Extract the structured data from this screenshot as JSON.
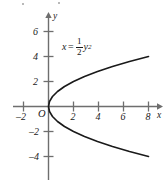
{
  "chart_data": {
    "type": "line",
    "title": "",
    "equation_label": {
      "lhs": "x",
      "relation": "=",
      "coefficient_numerator": "1",
      "coefficient_denominator": "2",
      "variable": "y",
      "exponent": "2",
      "plain": "x = 1/2 y^2"
    },
    "xlabel": "x",
    "ylabel": "y",
    "xlim": [
      -2.8,
      9.2
    ],
    "ylim": [
      -5.8,
      7.0
    ],
    "grid": false,
    "legend": null,
    "origin_label": "O",
    "xticks": [
      -2,
      2,
      4,
      6,
      8
    ],
    "xtick_labels": [
      "–2",
      "2",
      "4",
      "6",
      "8"
    ],
    "yticks": [
      2,
      4,
      6,
      -2,
      -4
    ],
    "ytick_labels": [
      "2",
      "4",
      "6",
      "–2",
      "–4"
    ],
    "curve": {
      "name": "x = 1/2 y^2",
      "color": "#1a1a1a",
      "y_values": [
        -4.0,
        -3.6,
        -3.2,
        -2.8,
        -2.4,
        -2.0,
        -1.6,
        -1.2,
        -0.8,
        -0.4,
        0.0,
        0.4,
        0.8,
        1.2,
        1.6,
        2.0,
        2.4,
        2.8,
        3.2,
        3.6,
        4.0
      ],
      "x_values": [
        8.0,
        6.48,
        5.12,
        3.92,
        2.88,
        2.0,
        1.28,
        0.72,
        0.32,
        0.08,
        0.0,
        0.08,
        0.32,
        0.72,
        1.28,
        2.0,
        2.88,
        3.92,
        5.12,
        6.48,
        8.0
      ]
    }
  },
  "axes": {
    "axis_color": "#6e6e6e",
    "curve_color": "#1a1a1a",
    "text_color": "#1a1a1a",
    "background": "#ffffff"
  }
}
